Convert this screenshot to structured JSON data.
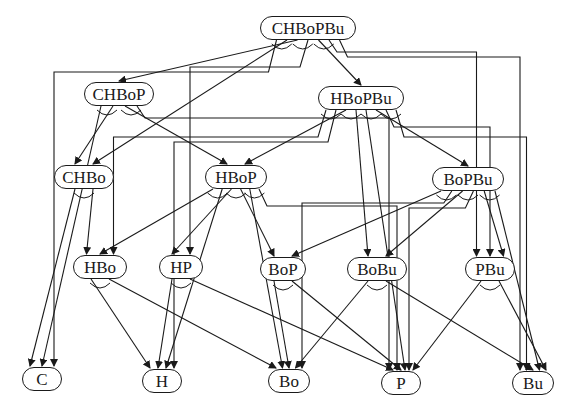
{
  "diagram": {
    "type": "and-or-decomposition-graph",
    "nodes": [
      {
        "id": "CHBoPBu",
        "label": "CHBoPBu",
        "x": 260,
        "y": 16,
        "w": 96
      },
      {
        "id": "CHBoP",
        "label": "CHBoP",
        "x": 84,
        "y": 82,
        "w": 70
      },
      {
        "id": "HBoPBu",
        "label": "HBoPBu",
        "x": 318,
        "y": 86,
        "w": 86
      },
      {
        "id": "CHBo",
        "label": "CHBo",
        "x": 54,
        "y": 165,
        "w": 60
      },
      {
        "id": "HBoP",
        "label": "HBoP",
        "x": 205,
        "y": 165,
        "w": 62
      },
      {
        "id": "BoPBu",
        "label": "BoPBu",
        "x": 432,
        "y": 167,
        "w": 72
      },
      {
        "id": "HBo",
        "label": "HBo",
        "x": 73,
        "y": 255,
        "w": 54
      },
      {
        "id": "HP",
        "label": "HP",
        "x": 159,
        "y": 255,
        "w": 44
      },
      {
        "id": "BoP",
        "label": "BoP",
        "x": 260,
        "y": 257,
        "w": 46
      },
      {
        "id": "BoBu",
        "label": "BoBu",
        "x": 347,
        "y": 257,
        "w": 60
      },
      {
        "id": "PBu",
        "label": "PBu",
        "x": 465,
        "y": 257,
        "w": 50
      },
      {
        "id": "C",
        "label": "C",
        "x": 22,
        "y": 367,
        "w": 40
      },
      {
        "id": "H",
        "label": "H",
        "x": 142,
        "y": 369,
        "w": 40
      },
      {
        "id": "Bo",
        "label": "Bo",
        "x": 268,
        "y": 369,
        "w": 42
      },
      {
        "id": "P",
        "label": "P",
        "x": 381,
        "y": 371,
        "w": 40
      },
      {
        "id": "Bu",
        "label": "Bu",
        "x": 512,
        "y": 371,
        "w": 42
      }
    ],
    "edges": [
      {
        "from": "CHBoPBu",
        "to": "CHBoP"
      },
      {
        "from": "CHBoPBu",
        "to": "HBoPBu"
      },
      {
        "from": "CHBoPBu",
        "to": "CHBo"
      },
      {
        "from": "CHBoPBu",
        "to": "HP"
      },
      {
        "from": "CHBoPBu",
        "to": "C"
      },
      {
        "from": "CHBoPBu",
        "to": "PBu"
      },
      {
        "from": "CHBoPBu",
        "to": "Bu"
      },
      {
        "from": "CHBoP",
        "to": "CHBo"
      },
      {
        "from": "CHBoP",
        "to": "HBoP"
      },
      {
        "from": "CHBoP",
        "to": "C"
      },
      {
        "from": "CHBoP",
        "to": "P"
      },
      {
        "from": "HBoPBu",
        "to": "HBoP"
      },
      {
        "from": "HBoPBu",
        "to": "BoPBu"
      },
      {
        "from": "HBoPBu",
        "to": "HBo"
      },
      {
        "from": "HBoPBu",
        "to": "H"
      },
      {
        "from": "HBoPBu",
        "to": "BoBu"
      },
      {
        "from": "HBoPBu",
        "to": "PBu"
      },
      {
        "from": "HBoPBu",
        "to": "P"
      },
      {
        "from": "HBoPBu",
        "to": "Bu"
      },
      {
        "from": "CHBo",
        "to": "HBo"
      },
      {
        "from": "CHBo",
        "to": "C"
      },
      {
        "from": "HBoP",
        "to": "HBo"
      },
      {
        "from": "HBoP",
        "to": "HP"
      },
      {
        "from": "HBoP",
        "to": "BoP"
      },
      {
        "from": "HBoP",
        "to": "H"
      },
      {
        "from": "HBoP",
        "to": "Bo"
      },
      {
        "from": "HBoP",
        "to": "P"
      },
      {
        "from": "BoPBu",
        "to": "BoP"
      },
      {
        "from": "BoPBu",
        "to": "BoBu"
      },
      {
        "from": "BoPBu",
        "to": "PBu"
      },
      {
        "from": "BoPBu",
        "to": "Bo"
      },
      {
        "from": "BoPBu",
        "to": "P"
      },
      {
        "from": "BoPBu",
        "to": "Bu"
      },
      {
        "from": "HBo",
        "to": "H"
      },
      {
        "from": "HBo",
        "to": "Bo"
      },
      {
        "from": "HP",
        "to": "H"
      },
      {
        "from": "HP",
        "to": "P"
      },
      {
        "from": "BoP",
        "to": "Bo"
      },
      {
        "from": "BoP",
        "to": "P"
      },
      {
        "from": "BoBu",
        "to": "Bo"
      },
      {
        "from": "BoBu",
        "to": "Bu"
      },
      {
        "from": "PBu",
        "to": "P"
      },
      {
        "from": "PBu",
        "to": "Bu"
      }
    ],
    "and_arcs_note": "Small arcs beneath each non-leaf node group pairs of outgoing edges into AND-decompositions."
  }
}
